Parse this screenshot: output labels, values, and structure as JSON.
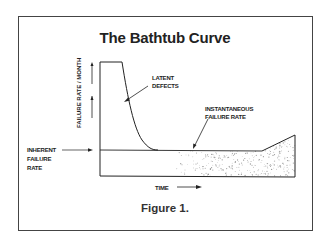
{
  "title": "The Bathtub Curve",
  "caption": "Figure 1.",
  "labels": {
    "y_axis": "FAILURE RATE / MONTH",
    "x_axis": "TIME",
    "latent_defects_line1": "LATENT",
    "latent_defects_line2": "DEFECTS",
    "instantaneous_line1": "INSTANTANEOUS",
    "instantaneous_line2": "FAILURE RATE",
    "inherent_line1": "INHERENT",
    "inherent_line2": "FAILURE",
    "inherent_line3": "RATE"
  },
  "colors": {
    "line": "#222222",
    "frame": "#444444",
    "stipple": "#999999"
  }
}
